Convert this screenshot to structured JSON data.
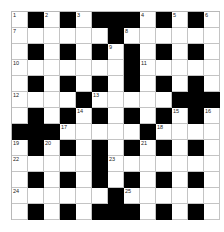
{
  "puzzle": {
    "rows": 13,
    "cols": 13,
    "grid": [
      "W.W.W...W.W.W",
      "WWWWWW.WWWWWW",
      "W.W.W.W.W.W.W",
      "WWWWWWW.WWWWW",
      "W.W.W.W.W.W.W",
      "WWWW.WWWWW...",
      "W.W.W.W.W.W.W",
      "...WWWWW.WWWW",
      "W.W.W.W.W.W.W",
      "WWWWW.WWWWWWW",
      "W.W.W.W.W.W.W",
      "WWWWWW.WWWWWW",
      "W.W.W...W.W.W"
    ],
    "numbers": [
      {
        "n": "1",
        "r": 0,
        "c": 0
      },
      {
        "n": "2",
        "r": 0,
        "c": 2
      },
      {
        "n": "3",
        "r": 0,
        "c": 4
      },
      {
        "n": "4",
        "r": 0,
        "c": 8
      },
      {
        "n": "5",
        "r": 0,
        "c": 10
      },
      {
        "n": "6",
        "r": 0,
        "c": 12
      },
      {
        "n": "7",
        "r": 1,
        "c": 0
      },
      {
        "n": "8",
        "r": 1,
        "c": 7
      },
      {
        "n": "9",
        "r": 2,
        "c": 6
      },
      {
        "n": "10",
        "r": 3,
        "c": 0
      },
      {
        "n": "11",
        "r": 3,
        "c": 8
      },
      {
        "n": "12",
        "r": 5,
        "c": 0
      },
      {
        "n": "13",
        "r": 5,
        "c": 5
      },
      {
        "n": "14",
        "r": 6,
        "c": 4
      },
      {
        "n": "15",
        "r": 6,
        "c": 10
      },
      {
        "n": "16",
        "r": 6,
        "c": 12
      },
      {
        "n": "17",
        "r": 7,
        "c": 3
      },
      {
        "n": "18",
        "r": 7,
        "c": 9
      },
      {
        "n": "19",
        "r": 8,
        "c": 0
      },
      {
        "n": "20",
        "r": 8,
        "c": 2
      },
      {
        "n": "21",
        "r": 8,
        "c": 8
      },
      {
        "n": "22",
        "r": 9,
        "c": 0
      },
      {
        "n": "23",
        "r": 9,
        "c": 6
      },
      {
        "n": "24",
        "r": 11,
        "c": 0
      },
      {
        "n": "25",
        "r": 11,
        "c": 7
      }
    ],
    "colors": {
      "block": "#000000",
      "cell": "#ffffff",
      "line": "#c4c4c4"
    }
  }
}
